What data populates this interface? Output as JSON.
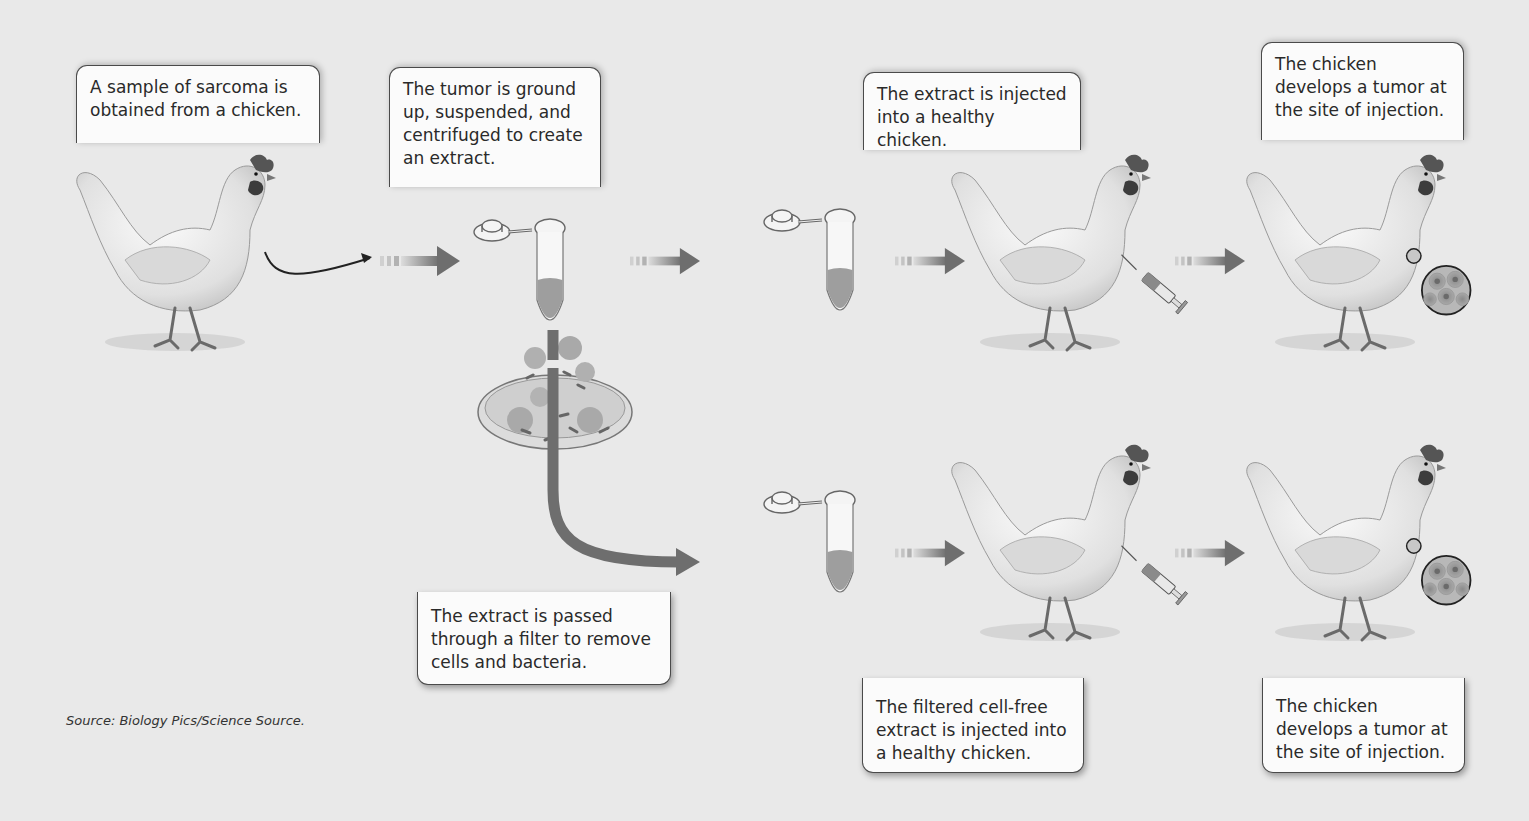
{
  "figure": {
    "background_color": "#e9e9e9",
    "accent_gray": "#6e6e6e",
    "steps": [
      {
        "id": "step-1",
        "text": "A sample of sarcoma is\nobtained from a chicken."
      },
      {
        "id": "step-2",
        "text": "The tumor is ground\nup, suspended, and\ncentrifuged to create\nan extract."
      },
      {
        "id": "step-3a",
        "text": "The extract is injected\ninto a healthy chicken."
      },
      {
        "id": "step-4a",
        "text": "The chicken\ndevelops a tumor at\nthe site of injection."
      },
      {
        "id": "step-filter",
        "text": "The extract is passed\nthrough a filter to remove\ncells and bacteria."
      },
      {
        "id": "step-3b",
        "text": "The filtered cell-free\nextract is injected into\na healthy chicken."
      },
      {
        "id": "step-4b",
        "text": "The chicken\ndevelops a tumor at\nthe site of injection."
      }
    ],
    "illustrations": {
      "source_chicken": "chicken-icon",
      "tube": "microcentrifuge-tube-icon",
      "filter": "filter-dish-icon",
      "syringe": "syringe-icon",
      "tumor_magnifier": "tumor-cells-magnifier-icon",
      "arrow": "arrow-right-icon"
    },
    "source_credit": "Source: Biology Pics/Science Source."
  }
}
